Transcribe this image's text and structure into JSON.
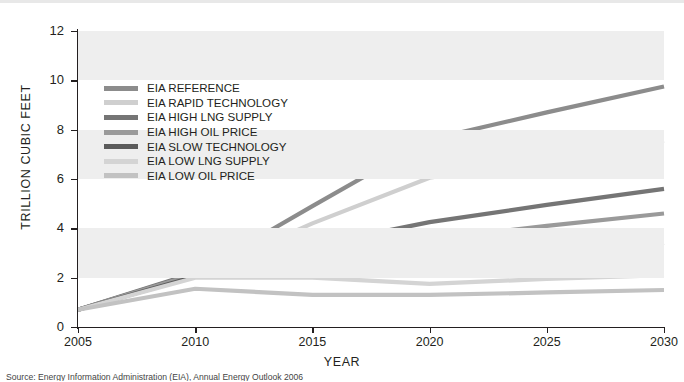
{
  "figure": {
    "caption": "Source: Energy Information Administration (EIA), Annual Energy Outlook 2006"
  },
  "chart_data": {
    "type": "line",
    "title": "",
    "xlabel": "YEAR",
    "ylabel": "TRILLION CUBIC FEET",
    "xlim": [
      2005,
      2030
    ],
    "ylim": [
      0,
      12
    ],
    "xticks": [
      "2005",
      "2010",
      "2015",
      "2020",
      "2025",
      "2030"
    ],
    "yticks": [
      "0",
      "2",
      "4",
      "6",
      "8",
      "10",
      "12"
    ],
    "grid": false,
    "bands": [
      [
        10,
        12
      ],
      [
        6,
        8
      ],
      [
        2,
        4
      ]
    ],
    "band_color": "#eeeeee",
    "legend_position": "upper-left",
    "x": [
      2005,
      2010,
      2015,
      2020,
      2025,
      2030
    ],
    "series": [
      {
        "name": "EIA REFERENCE",
        "color": "#8c8c8c",
        "width": 4.2,
        "values": [
          0.7,
          2.15,
          4.9,
          7.6,
          8.7,
          9.75
        ]
      },
      {
        "name": "EIA RAPID TECHNOLOGY",
        "color": "#cfcfcf",
        "width": 4.2,
        "values": [
          0.7,
          2.1,
          4.2,
          6.05,
          6.8,
          7.55
        ]
      },
      {
        "name": "EIA HIGH LNG SUPPLY",
        "color": "#757575",
        "width": 4.2,
        "values": [
          0.7,
          2.2,
          3.3,
          4.25,
          4.95,
          5.6
        ]
      },
      {
        "name": "EIA HIGH OIL PRICE",
        "color": "#9a9a9a",
        "width": 4.2,
        "values": [
          0.7,
          2.15,
          2.9,
          3.55,
          4.1,
          4.6
        ]
      },
      {
        "name": "EIA SLOW TECHNOLOGY",
        "color": "#5b5b5b",
        "width": 4.2,
        "values": [
          0.7,
          2.05,
          2.5,
          2.85,
          3.15,
          3.4
        ]
      },
      {
        "name": "EIA LOW LNG SUPPLY",
        "color": "#d4d4d4",
        "width": 4.2,
        "values": [
          0.7,
          2.0,
          2.0,
          1.75,
          1.95,
          2.1
        ]
      },
      {
        "name": "EIA LOW OIL PRICE",
        "color": "#c2c2c2",
        "width": 4.2,
        "values": [
          0.7,
          1.55,
          1.3,
          1.3,
          1.4,
          1.5
        ]
      }
    ]
  }
}
